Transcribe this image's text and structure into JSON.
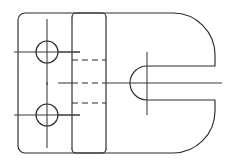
{
  "drawing": {
    "title": "Orthographic front view of a C-shaped bracket with two through holes and a keyhole slot",
    "view_name": "front-view",
    "background_color": "#ffffff",
    "line_color": "#2b2b2b",
    "centerline_color": "#3a3a3a",
    "canvas": {
      "width": 232,
      "height": 166
    },
    "geometry": {
      "body": {
        "name": "outer-profile",
        "left": 18,
        "top": 13,
        "right": 215,
        "bottom": 153,
        "left_corner_radius": 7,
        "right_corner_radius": 42
      },
      "rib": {
        "name": "center-rib-block",
        "left": 72,
        "right": 106,
        "top": 13,
        "bottom": 153,
        "corner_radius": 4
      },
      "holes": [
        {
          "name": "upper-through-hole",
          "cx": 47,
          "cy": 52,
          "r": 11,
          "centerline_h_x1": 14,
          "centerline_h_x2": 80,
          "centerline_v_y1": 19,
          "centerline_v_y2": 85
        },
        {
          "name": "lower-through-hole",
          "cx": 47,
          "cy": 115,
          "r": 11,
          "centerline_h_x1": 14,
          "centerline_h_x2": 80,
          "centerline_v_y1": 82,
          "centerline_v_y2": 148
        }
      ],
      "slot": {
        "name": "open-ended-slot",
        "arc_center_x": 147,
        "arc_center_y": 83,
        "radius": 17,
        "mouth_x": 215,
        "centerline_h_x1": 58,
        "centerline_h_x2": 222,
        "centerline_v_y1": 52,
        "centerline_v_y2": 115
      },
      "hidden_lines": [
        {
          "name": "upper-hidden-edge",
          "x1": 72,
          "x2": 106,
          "y": 60
        },
        {
          "name": "mid-hidden-edge",
          "x1": 72,
          "x2": 106,
          "y": 83
        },
        {
          "name": "lower-hidden-edge",
          "x1": 72,
          "x2": 106,
          "y": 103
        }
      ],
      "short_ticks": [
        {
          "name": "upper-left-tick",
          "x1": 58,
          "x2": 80,
          "y": 52
        },
        {
          "name": "lower-left-tick",
          "x1": 58,
          "x2": 80,
          "y": 115
        }
      ]
    },
    "legend": {
      "solid_line_meaning": "visible edge",
      "dashed_line_meaning": "hidden edge",
      "dash_dot_line_meaning": "center line"
    }
  }
}
